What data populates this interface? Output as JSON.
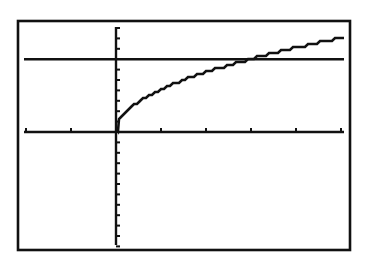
{
  "chart_data": {
    "type": "line",
    "title": "",
    "xlabel": "",
    "ylabel": "",
    "xlim": [
      -2,
      5.1
    ],
    "ylim": [
      -11,
      10
    ],
    "xscale": 1,
    "yscale": 1,
    "grid": false,
    "legend": null,
    "series": [
      {
        "name": "Y1 = 4*sqrt(X)",
        "x": [
          0,
          0.25,
          0.5,
          1,
          1.5,
          2,
          2.5,
          3,
          3.5,
          4,
          4.5,
          5,
          5.1
        ],
        "y": [
          0,
          2.0,
          2.83,
          4.0,
          4.9,
          5.66,
          6.32,
          6.93,
          7.48,
          8.0,
          8.49,
          8.94,
          9.03
        ]
      },
      {
        "name": "Y2 = 7",
        "x": [
          -2,
          5.1
        ],
        "y": [
          7,
          7
        ]
      }
    ],
    "x_ticks": [
      -2,
      -1,
      1,
      2,
      3,
      4,
      5
    ],
    "y_ticks": [
      -11,
      -10,
      -9,
      -8,
      -7,
      -6,
      -5,
      -4,
      -3,
      -2,
      -1,
      1,
      2,
      3,
      4,
      5,
      6,
      8,
      9,
      10
    ],
    "annotations": []
  },
  "layout": {
    "frame": {
      "x": 18,
      "y": 21,
      "w": 332,
      "h": 229
    },
    "plot": {
      "x0": 24,
      "x1": 344,
      "y0": 27,
      "y1": 245
    },
    "origin_px": {
      "x": 116,
      "y": 132
    },
    "unit_px": {
      "x": 45,
      "y": 10.4
    },
    "colors": {
      "ink": "#111111",
      "background": "#ffffff"
    }
  }
}
